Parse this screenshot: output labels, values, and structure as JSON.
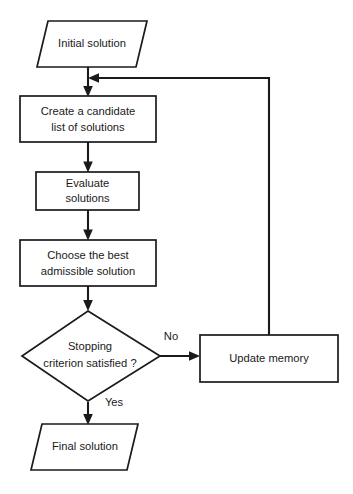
{
  "diagram": {
    "background_color": "#ffffff",
    "stroke_color": "#1a1a1a",
    "nodes": [
      {
        "id": "initial-solution",
        "shape": "parallelogram",
        "label": "Initial solution"
      },
      {
        "id": "create-candidate-list",
        "shape": "rectangle",
        "label_line1": "Create a candidate",
        "label_line2": "list of solutions"
      },
      {
        "id": "evaluate-solutions",
        "shape": "rectangle",
        "label_line1": "Evaluate",
        "label_line2": "solutions"
      },
      {
        "id": "choose-best-admissible",
        "shape": "rectangle",
        "label_line1": "Choose the best",
        "label_line2": "admissible solution"
      },
      {
        "id": "stopping-criterion",
        "shape": "diamond",
        "label_line1": "Stopping",
        "label_line2": "criterion satisfied ?"
      },
      {
        "id": "update-memory",
        "shape": "rectangle",
        "label": "Update memory"
      },
      {
        "id": "final-solution",
        "shape": "parallelogram",
        "label": "Final solution"
      }
    ],
    "edge_labels": {
      "no": "No",
      "yes": "Yes"
    }
  }
}
